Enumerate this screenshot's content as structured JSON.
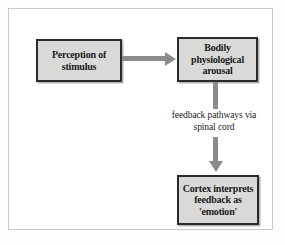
{
  "diagram": {
    "frame_color": "#c9c9c9",
    "box_fill": "#d9d9d7",
    "box_border": "#2b2b2b",
    "arrow_color": "#8c8c8c",
    "nodes": [
      {
        "id": "perception",
        "label": "Perception of\nstimulus"
      },
      {
        "id": "arousal",
        "label": "Bodily\nphysiological\narousal"
      },
      {
        "id": "cortex",
        "label": "Cortex interprets\nfeedback as\n'emotion'"
      }
    ],
    "edge_label": "feedback pathways via\nspinal cord",
    "connectors": [
      {
        "id": "perception-to-arousal",
        "orientation": "horizontal",
        "arrowhead": "right"
      },
      {
        "id": "arousal-to-label",
        "orientation": "vertical",
        "arrowhead": "none"
      },
      {
        "id": "label-to-cortex",
        "orientation": "vertical",
        "arrowhead": "down"
      }
    ]
  }
}
